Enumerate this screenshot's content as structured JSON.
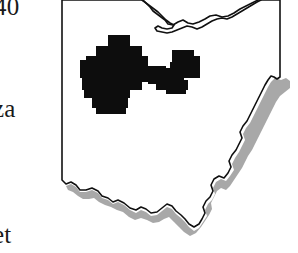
{
  "figure": {
    "type": "thematic-choropleth-map",
    "background_color": "#ffffff"
  },
  "margin_labels": {
    "top": "40",
    "middle": "za",
    "bottom": "et",
    "note": "Text fragments clipped at the left edge of the cropped figure"
  },
  "colors": {
    "outline": "#111111",
    "shaded_region": "#0d0d0d",
    "river_shadow": "#a8a8a8",
    "background": "#ffffff"
  },
  "legend_items": [
    {
      "swatch": "#0d0d0d",
      "label": "Shaded study area"
    },
    {
      "swatch": "#a8a8a8",
      "label": "River boundary shading"
    }
  ],
  "map_geometry": {
    "state_outline": "M 62,8 L 62,180 L 66,184 L 71,182 L 76,185 L 80,190 L 86,190 L 92,188 L 98,191 L 102,196 L 108,198 L 113,202 L 118,200 L 124,203 L 130,208 L 136,210 L 141,207 L 146,209 L 151,213 L 157,212 L 162,208 L 167,204 L 172,206 L 176,211 L 181,215 L 185,219 L 189,224 L 194,227 L 199,224 L 202,219 L 205,213 L 203,207 L 206,201 L 210,197 L 213,191 L 211,185 L 214,179 L 219,176 L 224,178 L 228,173 L 231,167 L 229,161 L 232,155 L 236,150 L 239,144 L 242,138 L 240,132 L 243,126 L 247,121 L 250,115 L 253,109 L 256,103 L 259,97 L 262,91 L 265,85 L 268,80 L 271,76 L 274,77 L 277,79 L 280,77 L 280,0 L 258,0 L 252,3 L 246,6 L 240,9 L 234,13 L 228,16 L 222,17 L 216,15 L 210,16 L 205,19 L 199,22 L 193,24 L 188,23 L 183,20 L 178,22 L 173,25 L 168,24 L 165,20 L 161,17 L 157,14 L 153,11 L 150,7 L 147,4 L 144,1 L 142,0 L 62,0 Z",
    "lake_erie_shore": "M 142,0 L 146,3 L 150,6 L 154,9 L 158,12 L 162,16 L 166,20 L 170,23 L 174,25 L 172,28 L 167,29 L 162,28 L 158,26 L 155,28 L 157,31 L 162,32 L 167,33 L 172,32 L 177,30 L 182,28 L 187,26 L 192,27 L 197,29 L 202,27 L 207,24 L 212,21 L 217,19 L 222,18 L 227,19 L 232,17 L 237,14 L 242,11 L 247,8 L 252,5 L 257,2 L 261,0",
    "shaded_blocks": [
      {
        "x": 108,
        "y": 35,
        "w": 22,
        "h": 11
      },
      {
        "x": 96,
        "y": 46,
        "w": 46,
        "h": 10
      },
      {
        "x": 86,
        "y": 56,
        "w": 62,
        "h": 10
      },
      {
        "x": 80,
        "y": 60,
        "w": 68,
        "h": 12
      },
      {
        "x": 80,
        "y": 66,
        "w": 86,
        "h": 12
      },
      {
        "x": 82,
        "y": 72,
        "w": 84,
        "h": 10
      },
      {
        "x": 82,
        "y": 78,
        "w": 60,
        "h": 12
      },
      {
        "x": 84,
        "y": 86,
        "w": 46,
        "h": 12
      },
      {
        "x": 92,
        "y": 96,
        "w": 36,
        "h": 12
      },
      {
        "x": 96,
        "y": 104,
        "w": 30,
        "h": 10
      },
      {
        "x": 142,
        "y": 68,
        "w": 32,
        "h": 10
      },
      {
        "x": 148,
        "y": 74,
        "w": 36,
        "h": 10
      },
      {
        "x": 156,
        "y": 80,
        "w": 32,
        "h": 10
      },
      {
        "x": 166,
        "y": 86,
        "w": 20,
        "h": 8
      },
      {
        "x": 172,
        "y": 50,
        "w": 22,
        "h": 22
      },
      {
        "x": 170,
        "y": 62,
        "w": 30,
        "h": 16
      },
      {
        "x": 178,
        "y": 56,
        "w": 22,
        "h": 12
      }
    ],
    "river_shadow": "M 66,186 L 71,184 L 76,187 L 80,192 L 86,192 L 92,190 L 98,193 L 102,198 L 108,200 L 113,204 L 118,202 L 124,205 L 130,210 L 136,213 L 141,210 L 146,212 L 151,216 L 157,215 L 162,211 L 167,207 L 172,209 L 176,214 L 181,218 L 185,222 L 189,227 L 194,231 L 199,228 L 203,222 L 207,216 L 205,210 L 208,204 L 212,200 L 215,194 L 213,188 L 216,182 L 221,179 L 226,181 L 230,176 L 234,170 L 232,164 L 235,158 L 239,152 L 242,146 L 245,140 L 243,134 L 246,128 L 250,123 L 253,117 L 256,111 L 259,105 L 262,99 L 265,93 L 268,87 L 271,82 L 275,78 L 281,80 L 286,78 L 290,81 L 290,88 L 285,92 L 280,96 L 276,102 L 273,108 L 270,114 L 267,120 L 264,126 L 261,132 L 258,138 L 255,144 L 252,150 L 248,156 L 245,162 L 242,168 L 238,174 L 234,180 L 230,186 L 226,190 L 221,188 L 217,191 L 214,197 L 211,203 L 212,209 L 209,215 L 205,221 L 201,227 L 196,233 L 190,236 L 184,232 L 179,227 L 174,222 L 169,217 L 164,219 L 159,222 L 153,223 L 147,220 L 141,218 L 135,220 L 129,217 L 123,212 L 117,210 L 111,207 L 105,205 L 99,202 L 94,198 L 89,199 L 83,199 L 78,196 L 73,192 L 68,190 Z"
  }
}
